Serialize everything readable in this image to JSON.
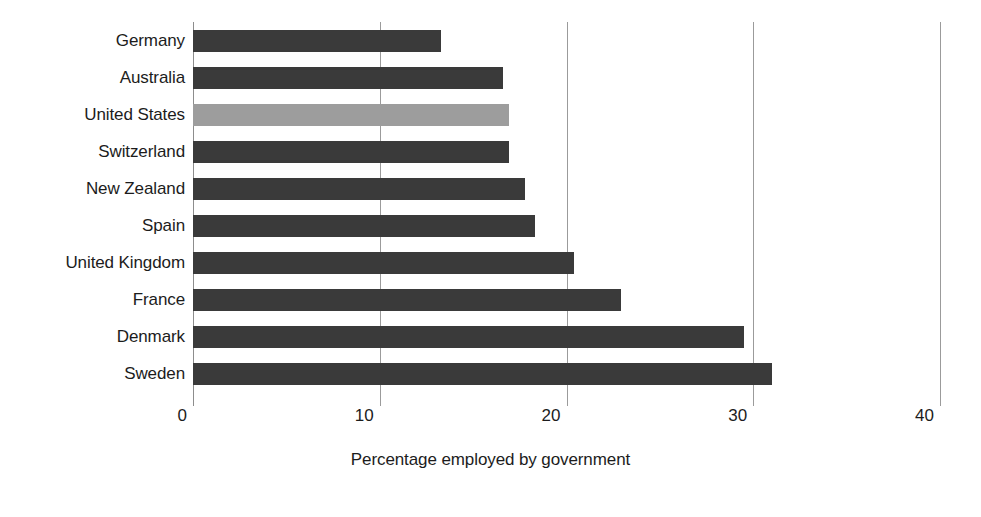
{
  "chart_data": {
    "type": "bar",
    "orientation": "horizontal",
    "title": "",
    "xlabel": "Percentage employed by government",
    "ylabel": "",
    "xlim": [
      0,
      40
    ],
    "xticks": [
      0,
      10,
      20,
      30,
      40
    ],
    "xtick_labels": [
      "0",
      "10",
      "20",
      "30",
      "40"
    ],
    "grid": true,
    "grid_axis": "x",
    "legend": null,
    "categories": [
      "Germany",
      "Australia",
      "United States",
      "Switzerland",
      "New Zealand",
      "Spain",
      "United Kingdom",
      "France",
      "Denmark",
      "Sweden"
    ],
    "values": [
      13.3,
      16.6,
      16.9,
      16.9,
      17.8,
      18.3,
      20.4,
      22.9,
      29.5,
      31.0
    ],
    "highlight_category": "United States",
    "colors": {
      "bar": "#3a3a3a",
      "bar_highlight": "#9d9d9d",
      "gridline": "#9b9b9b",
      "text": "#1c1c1c",
      "background": "#ffffff"
    }
  }
}
